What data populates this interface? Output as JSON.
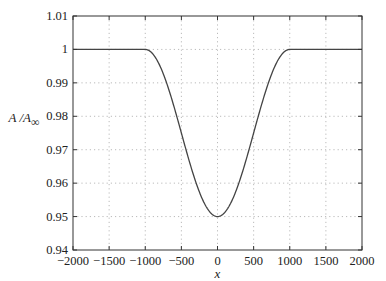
{
  "chart_data": {
    "type": "line",
    "title": "",
    "xlabel": "x",
    "ylabel": "A / A∞",
    "xlim": [
      -2000,
      2000
    ],
    "ylim": [
      0.94,
      1.01
    ],
    "xticks": [
      -2000,
      -1500,
      -1000,
      -500,
      0,
      500,
      1000,
      1500,
      2000
    ],
    "yticks": [
      0.94,
      0.95,
      0.96,
      0.97,
      0.98,
      0.99,
      1,
      1.01
    ],
    "xtick_labels": [
      "−2000",
      "−1500",
      "−1000",
      "−500",
      "0",
      "500",
      "1000",
      "1500",
      "2000"
    ],
    "ytick_labels": [
      "0.94",
      "0.95",
      "0.96",
      "0.97",
      "0.98",
      "0.99",
      "1",
      "1.01"
    ],
    "grid": true,
    "legend": null,
    "series": [
      {
        "name": "A/A∞",
        "x": [
          -2000,
          -1500,
          -1000,
          -900,
          -800,
          -700,
          -600,
          -500,
          -400,
          -300,
          -200,
          -100,
          0,
          100,
          200,
          300,
          400,
          500,
          600,
          700,
          800,
          900,
          1000,
          1500,
          2000
        ],
        "values": [
          1.0,
          1.0,
          1.0,
          0.9994,
          0.9976,
          0.9947,
          0.9909,
          0.975,
          0.9591,
          0.9647,
          0.9738,
          0.9512,
          0.95,
          0.9512,
          0.9738,
          0.9647,
          0.9591,
          0.975,
          0.9909,
          0.9947,
          0.9976,
          0.9994,
          1.0,
          1.0,
          1.0
        ],
        "formula": "A = 1 for |x| >= 1000; A = 1 - 0.025*(1+cos(pi*x/1000)) for |x| < 1000",
        "min": {
          "x": 0,
          "y": 0.95
        }
      }
    ]
  },
  "layout": {
    "plot_left": 73,
    "plot_right": 362,
    "plot_top": 16,
    "plot_bottom": 250,
    "line_color": "#444444",
    "grid_color": "#aaaaaa",
    "axis_color": "#333333"
  }
}
